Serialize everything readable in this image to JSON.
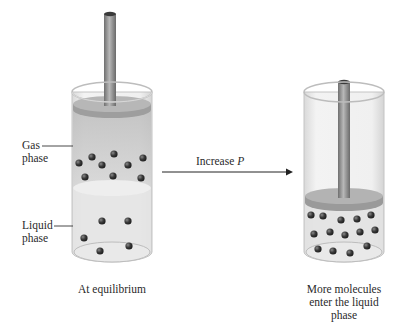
{
  "diagram": {
    "left_cylinder": {
      "caption": "At equilibrium",
      "labels": {
        "gas": [
          "Gas",
          "phase"
        ],
        "liquid": [
          "Liquid",
          "phase"
        ]
      },
      "gas_molecule_count": 10,
      "liquid_molecule_count": 5
    },
    "arrow": {
      "label_prefix": "Increase ",
      "label_var": "P"
    },
    "right_cylinder": {
      "caption": [
        "More molecules",
        "enter the liquid",
        "phase"
      ],
      "liquid_molecule_count": 14
    },
    "colors": {
      "glass": "#e8e8e8",
      "glass_edge": "#c8c8c8",
      "gas_fill": "#cfcfcf",
      "liquid_fill": "#e6e6e6",
      "piston": "#a8a8a8",
      "rod": "#8a8a8a",
      "molecule": "#3a3a3a",
      "arrow": "#222222"
    }
  }
}
